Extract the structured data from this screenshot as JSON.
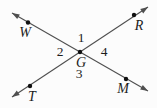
{
  "figure": {
    "width": 157,
    "height": 108,
    "background_color": "#fcfcfc",
    "line_color": "#4f4f4f",
    "dot_color": "#101010",
    "text_color": "#1c1c1c",
    "line_width": 1.1,
    "dot_radius": 2.2
  },
  "arrow": {
    "length": 7.5,
    "half_width": 2.7
  },
  "lines": [
    {
      "name": "WM",
      "x1": 12,
      "y1": 13,
      "x2": 148,
      "y2": 91
    },
    {
      "name": "TR",
      "x1": 12,
      "y1": 97,
      "x2": 148,
      "y2": 7
    }
  ],
  "points": [
    {
      "label": "W",
      "x": 28,
      "y": 22.5,
      "label_x": 25,
      "label_y": 37
    },
    {
      "label": "R",
      "x": 134,
      "y": 15,
      "label_x": 139,
      "label_y": 30
    },
    {
      "label": "T",
      "x": 30,
      "y": 86,
      "label_x": 32,
      "label_y": 101
    },
    {
      "label": "M",
      "x": 126,
      "y": 79,
      "label_x": 123,
      "label_y": 92.5
    },
    {
      "label": "G",
      "x": 80,
      "y": 52,
      "label_x": 81,
      "label_y": 67
    }
  ],
  "angle_labels": [
    {
      "text": "1",
      "x": 81,
      "y": 42
    },
    {
      "text": "2",
      "x": 60,
      "y": 56
    },
    {
      "text": "3",
      "x": 79,
      "y": 78
    },
    {
      "text": "4",
      "x": 104,
      "y": 56
    }
  ]
}
